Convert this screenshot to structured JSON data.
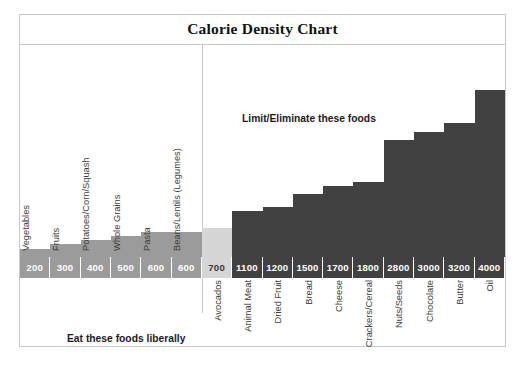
{
  "title": "Calorie Density Chart",
  "annotations": {
    "limit": "Limit/Eliminate these foods",
    "eat": "Eat these foods liberally"
  },
  "colors": {
    "low_density_bar": "#9b9b9b",
    "avocado_bar": "#d6d6d6",
    "high_density_bar": "#414141",
    "frame": "#c9c9c9",
    "background": "#ffffff",
    "label_text": "#3c3c3c"
  },
  "chart_data": {
    "type": "bar",
    "title": "Calorie Density Chart",
    "xlabel": "",
    "ylabel": "Calories per pound",
    "ylim": [
      0,
      4000
    ],
    "grid": false,
    "legend": "none",
    "categories": [
      "Vegetables",
      "Fruits",
      "Potatoes/Corn/Squash",
      "Whole Grains",
      "Pasta",
      "Beans/Lentils (Legumes)",
      "Avocados",
      "Animal Meat",
      "Dried Fruit",
      "Bread",
      "Cheese",
      "Crackers/Cereal",
      "Nuts/Seeds",
      "Chocolate",
      "Butter",
      "Oil"
    ],
    "values": [
      200,
      300,
      400,
      500,
      600,
      600,
      700,
      1100,
      1200,
      1500,
      1700,
      1800,
      2800,
      3000,
      3200,
      4000
    ],
    "groups": [
      {
        "name": "Eat these foods liberally",
        "categories": [
          "Vegetables",
          "Fruits",
          "Potatoes/Corn/Squash",
          "Whole Grains",
          "Pasta",
          "Beans/Lentils (Legumes)"
        ],
        "values": [
          200,
          300,
          400,
          500,
          600,
          600
        ]
      },
      {
        "name": "Limit/Eliminate these foods",
        "categories": [
          "Avocados",
          "Animal Meat",
          "Dried Fruit",
          "Bread",
          "Cheese",
          "Crackers/Cereal",
          "Nuts/Seeds",
          "Chocolate",
          "Butter",
          "Oil"
        ],
        "values": [
          700,
          1100,
          1200,
          1500,
          1700,
          1800,
          2800,
          3000,
          3200,
          4000
        ]
      }
    ]
  },
  "bars": [
    {
      "label": "Vegetables",
      "value": 200,
      "value_text": "200",
      "style": "light",
      "label_pos": "top"
    },
    {
      "label": "Fruits",
      "value": 300,
      "value_text": "300",
      "style": "light",
      "label_pos": "top"
    },
    {
      "label": "Potatoes/Corn/Squash",
      "value": 400,
      "value_text": "400",
      "style": "light",
      "label_pos": "top"
    },
    {
      "label": "Whole Grains",
      "value": 500,
      "value_text": "500",
      "style": "light",
      "label_pos": "top"
    },
    {
      "label": "Pasta",
      "value": 600,
      "value_text": "600",
      "style": "light",
      "label_pos": "top"
    },
    {
      "label": "Beans/Lentils (Legumes)",
      "value": 600,
      "value_text": "600",
      "style": "light",
      "label_pos": "top"
    },
    {
      "label": "Avocados",
      "value": 700,
      "value_text": "700",
      "style": "avocado",
      "label_pos": "bottom"
    },
    {
      "label": "Animal Meat",
      "value": 1100,
      "value_text": "1100",
      "style": "dark",
      "label_pos": "bottom"
    },
    {
      "label": "Dried Fruit",
      "value": 1200,
      "value_text": "1200",
      "style": "dark",
      "label_pos": "bottom"
    },
    {
      "label": "Bread",
      "value": 1500,
      "value_text": "1500",
      "style": "dark",
      "label_pos": "bottom"
    },
    {
      "label": "Cheese",
      "value": 1700,
      "value_text": "1700",
      "style": "dark",
      "label_pos": "bottom"
    },
    {
      "label": "Crackers/Cereal",
      "value": 1800,
      "value_text": "1800",
      "style": "dark",
      "label_pos": "bottom"
    },
    {
      "label": "Nuts/Seeds",
      "value": 2800,
      "value_text": "2800",
      "style": "dark",
      "label_pos": "bottom"
    },
    {
      "label": "Chocolate",
      "value": 3000,
      "value_text": "3000",
      "style": "dark",
      "label_pos": "bottom"
    },
    {
      "label": "Butter",
      "value": 3200,
      "value_text": "3200",
      "style": "dark",
      "label_pos": "bottom"
    },
    {
      "label": "Oil",
      "value": 4000,
      "value_text": "4000",
      "style": "dark",
      "label_pos": "bottom"
    }
  ]
}
